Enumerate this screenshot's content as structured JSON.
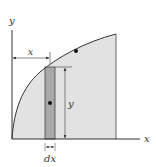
{
  "diagram": {
    "type": "area-under-curve-strip",
    "labels": {
      "y_axis": "y",
      "x_axis": "x",
      "x_dimension": "x",
      "y_dimension": "y",
      "strip_width": "dx"
    },
    "colors": {
      "region_fill": "#e2e2e2",
      "strip_fill": "#a8a8a8",
      "line": "#333333",
      "dot": "#111111",
      "background": "#ffffff"
    },
    "elements": [
      "y-axis",
      "x-axis",
      "curve-boundary",
      "shaded-region",
      "vertical-strip",
      "strip-centroid-dot",
      "region-centroid-dot",
      "x-dimension-arrow",
      "y-dimension-arrow",
      "dx-dimension-arrows"
    ]
  }
}
